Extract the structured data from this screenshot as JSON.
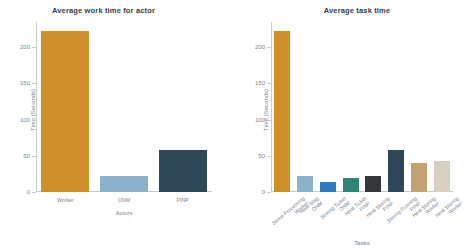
{
  "chart_data": [
    {
      "type": "bar",
      "title": "Average work time for actor",
      "xlabel": "Actors",
      "ylabel": "Time (Seconds)",
      "categories": [
        "Worker",
        "ONM",
        "PINP"
      ],
      "values": [
        222,
        22,
        58
      ],
      "colors": [
        "#cf8f29",
        "#8cb3cc",
        "#2f4858"
      ],
      "ylim": [
        0,
        235
      ],
      "yticks": [
        0,
        50,
        100,
        150,
        200
      ],
      "ytick_labels": [
        "0",
        "50",
        "100",
        "150",
        "200"
      ],
      "grid": false,
      "legend": "none"
    },
    {
      "type": "bar",
      "title": "Average task time",
      "xlabel": "Tasks",
      "ylabel": "Time (Seconds)",
      "categories": [
        "Stone Processing\nWorker",
        "Heat Slag\nONM",
        "Storing Ticket\nONM",
        "Heat Ticket\nPINP",
        "Heat Storing\nPINP",
        "Storing Running\nPINP",
        "Heat Storing\nWorker",
        "Heat Storing\nWorker"
      ],
      "category_lines": [
        [
          "Stone Processing",
          "Worker"
        ],
        [
          "Heat Slag",
          "ONM"
        ],
        [
          "Storing Ticket",
          "ONM"
        ],
        [
          "Heat Ticket",
          "PINP"
        ],
        [
          "Heat Storing",
          "PINP"
        ],
        [
          "Storing Running",
          "PINP"
        ],
        [
          "Heat Storing",
          "Worker"
        ],
        [
          "Heat Storing",
          "Worker"
        ]
      ],
      "values": [
        222,
        22,
        14,
        20,
        22,
        58,
        40,
        43
      ],
      "colors": [
        "#cf8f29",
        "#8cb3cc",
        "#2e7bbf",
        "#2d8577",
        "#33363b",
        "#2f4858",
        "#c2a173",
        "#d9cfc0"
      ],
      "ylim": [
        0,
        235
      ],
      "yticks": [
        0,
        50,
        100,
        150,
        200
      ],
      "ytick_labels": [
        "0",
        "50",
        "100",
        "150",
        "200"
      ],
      "grid": false,
      "legend": "none"
    }
  ]
}
